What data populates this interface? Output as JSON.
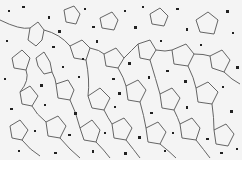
{
  "image": {
    "subject": "metallographic micrograph of polygonal grain structure with dark precipitates",
    "colors": {
      "background": "#f4f4f4",
      "grain_boundary": "#4a4a4a",
      "particle": "#1e1e1e"
    }
  },
  "caption": {
    "text": ""
  }
}
